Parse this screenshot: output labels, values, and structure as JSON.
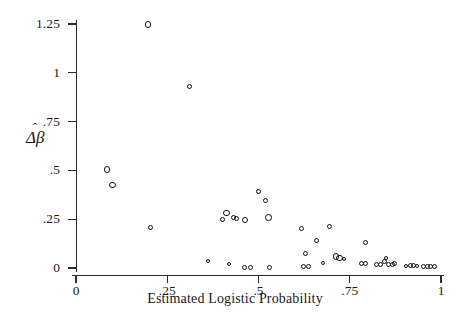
{
  "chart_data": {
    "type": "scatter",
    "title": "",
    "xlabel": "Estimated Logistic Probability",
    "ylabel": "Δβ̂",
    "ylabel_base": "Δβ",
    "ylabel_hat": "ˆ",
    "xlim": [
      0,
      1
    ],
    "ylim": [
      0,
      1.25
    ],
    "grid": false,
    "legend": null,
    "marker": "open-circle",
    "marker_color": "#111111",
    "xticks": [
      0,
      0.25,
      0.5,
      0.75,
      1
    ],
    "xtick_labels": [
      "0",
      ".25",
      ".5",
      ".75",
      "1"
    ],
    "yticks": [
      0,
      0.25,
      0.5,
      0.75,
      1,
      1.25
    ],
    "ytick_labels": [
      "0",
      ".25",
      ".5",
      ".75",
      "1",
      "1.25"
    ],
    "points": [
      {
        "x": 0.085,
        "y": 0.505,
        "size": "lg"
      },
      {
        "x": 0.1,
        "y": 0.425,
        "size": "lg"
      },
      {
        "x": 0.197,
        "y": 1.248,
        "size": "lg"
      },
      {
        "x": 0.205,
        "y": 0.205,
        "size": "md"
      },
      {
        "x": 0.31,
        "y": 0.93,
        "size": "md"
      },
      {
        "x": 0.362,
        "y": 0.035,
        "size": "sm"
      },
      {
        "x": 0.4,
        "y": 0.25,
        "size": "md"
      },
      {
        "x": 0.412,
        "y": 0.283,
        "size": "lg"
      },
      {
        "x": 0.418,
        "y": 0.018,
        "size": "sm"
      },
      {
        "x": 0.432,
        "y": 0.258,
        "size": "md"
      },
      {
        "x": 0.44,
        "y": 0.252,
        "size": "md"
      },
      {
        "x": 0.463,
        "y": 0.245,
        "size": "lg"
      },
      {
        "x": 0.462,
        "y": 0.005,
        "size": "md"
      },
      {
        "x": 0.478,
        "y": 0.005,
        "size": "md"
      },
      {
        "x": 0.5,
        "y": 0.392,
        "size": "md"
      },
      {
        "x": 0.518,
        "y": 0.348,
        "size": "md"
      },
      {
        "x": 0.527,
        "y": 0.258,
        "size": "lg"
      },
      {
        "x": 0.53,
        "y": 0.005,
        "size": "md"
      },
      {
        "x": 0.618,
        "y": 0.2,
        "size": "md"
      },
      {
        "x": 0.622,
        "y": 0.008,
        "size": "md"
      },
      {
        "x": 0.628,
        "y": 0.072,
        "size": "md"
      },
      {
        "x": 0.638,
        "y": 0.01,
        "size": "md"
      },
      {
        "x": 0.66,
        "y": 0.142,
        "size": "md"
      },
      {
        "x": 0.678,
        "y": 0.025,
        "size": "sm"
      },
      {
        "x": 0.695,
        "y": 0.212,
        "size": "md"
      },
      {
        "x": 0.712,
        "y": 0.06,
        "size": "lg"
      },
      {
        "x": 0.722,
        "y": 0.052,
        "size": "lg"
      },
      {
        "x": 0.735,
        "y": 0.048,
        "size": "sm"
      },
      {
        "x": 0.782,
        "y": 0.022,
        "size": "md"
      },
      {
        "x": 0.793,
        "y": 0.022,
        "size": "md"
      },
      {
        "x": 0.793,
        "y": 0.132,
        "size": "md"
      },
      {
        "x": 0.822,
        "y": 0.02,
        "size": "md"
      },
      {
        "x": 0.833,
        "y": 0.02,
        "size": "md"
      },
      {
        "x": 0.845,
        "y": 0.032,
        "size": "md"
      },
      {
        "x": 0.848,
        "y": 0.052,
        "size": "sm"
      },
      {
        "x": 0.856,
        "y": 0.018,
        "size": "md"
      },
      {
        "x": 0.866,
        "y": 0.018,
        "size": "md"
      },
      {
        "x": 0.872,
        "y": 0.022,
        "size": "md"
      },
      {
        "x": 0.905,
        "y": 0.01,
        "size": "sm"
      },
      {
        "x": 0.917,
        "y": 0.012,
        "size": "md"
      },
      {
        "x": 0.926,
        "y": 0.012,
        "size": "md"
      },
      {
        "x": 0.935,
        "y": 0.01,
        "size": "sm"
      },
      {
        "x": 0.952,
        "y": 0.01,
        "size": "md"
      },
      {
        "x": 0.962,
        "y": 0.01,
        "size": "md"
      },
      {
        "x": 0.972,
        "y": 0.01,
        "size": "md"
      },
      {
        "x": 0.982,
        "y": 0.01,
        "size": "md"
      }
    ]
  }
}
